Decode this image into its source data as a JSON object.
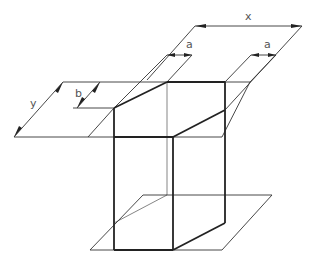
{
  "diagram": {
    "title": "",
    "labels": {
      "x": "x",
      "a_left": "a",
      "a_right": "a",
      "y": "y",
      "b": "b"
    },
    "colors": {
      "thin_line": "#333333",
      "thick_line": "#222222",
      "label": "#555555",
      "background": "#ffffff"
    }
  }
}
